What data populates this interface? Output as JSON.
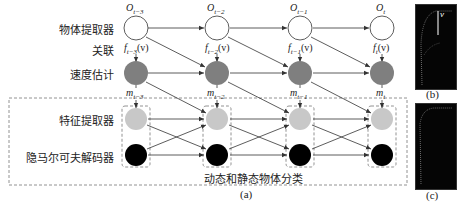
{
  "diagram": {
    "row_labels": {
      "object_extractor": "物体提取器",
      "association": "关联",
      "velocity_estimation": "速度估计",
      "feature_extractor": "特征提取器",
      "hmm_decoder": "隐马尔可夫解码器"
    },
    "group_label": "动态和静态物体分类",
    "time_steps": [
      {
        "o": "O",
        "o_sub": "t−3",
        "f": "f",
        "f_sub": "t−3",
        "f_arg": "(v)",
        "m": "m",
        "m_sub": "t−3"
      },
      {
        "o": "O",
        "o_sub": "t−2",
        "f": "f",
        "f_sub": "t−2",
        "f_arg": "(v)",
        "m": "m",
        "m_sub": "t−2"
      },
      {
        "o": "O",
        "o_sub": "t−1",
        "f": "f",
        "f_sub": "t−1",
        "f_arg": "(v)",
        "m": "m",
        "m_sub": "t−1"
      },
      {
        "o": "O",
        "o_sub": "t",
        "f": "f",
        "f_sub": "t",
        "f_arg": "(v)",
        "m": "m",
        "m_sub": "t"
      }
    ],
    "captions": {
      "a": "(a)",
      "b": "(b)",
      "c": "(c)"
    },
    "thumb_b_label": "v",
    "colors": {
      "object_node": "#ffffff",
      "velocity_node": "#7f7f7f",
      "feature_node": "#c8c8c8",
      "hmm_node": "#000000",
      "edge": "#333333",
      "dashed": "#777777"
    }
  }
}
